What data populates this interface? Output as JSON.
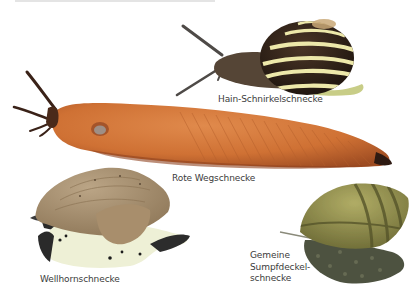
{
  "figure": {
    "background": "#ffffff",
    "specimens": [
      {
        "id": "hain-schnirkelschnecke",
        "label": "Hain-Schnirkelschnecke",
        "colors": {
          "shell_dark": "#2a1e16",
          "shell_band": "#ece7a8",
          "body": "#5a4b3f",
          "foot": "#c9cf8a"
        }
      },
      {
        "id": "rote-wegschnecke",
        "label": "Rote Wegschnecke",
        "colors": {
          "body": "#d2763a",
          "body_shade": "#a9552a",
          "head": "#3a2218"
        }
      },
      {
        "id": "wellhornschnecke",
        "label": "Wellhornschnecke",
        "colors": {
          "shell": "#a89274",
          "foot": "#eef0d8",
          "spots": "#1b1b1b"
        }
      },
      {
        "id": "gemeine-sumpfdeckelschnecke",
        "label": "Gemeine\nSumpfdeckel-\nschnecke",
        "colors": {
          "shell": "#8f8c4a",
          "shell_band": "#5c5b2c",
          "body": "#555a46"
        }
      }
    ]
  }
}
